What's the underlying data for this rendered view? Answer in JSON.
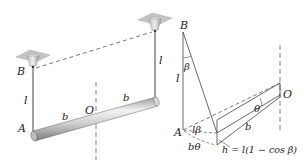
{
  "figure": {
    "left_view": {
      "labels": {
        "B": "B",
        "A": "A",
        "O": "O",
        "l_left": "l",
        "l_right": "l",
        "b_left": "b",
        "b_right": "b"
      },
      "elements": [
        "ceiling-mount-left",
        "ceiling-mount-right",
        "wire-left",
        "wire-right",
        "rod",
        "vertical-axis",
        "dashed-top-line"
      ]
    },
    "right_view": {
      "labels": {
        "B": "B",
        "A": "A",
        "O": "O",
        "l": "l",
        "beta": "β",
        "theta": "θ",
        "l_beta": "lβ",
        "b_theta": "bθ",
        "b": "b",
        "h_formula": "h = l(1 − cos β)"
      }
    }
  },
  "colors": {
    "line": "#444444",
    "rod_light": "#e8e8e8",
    "rod_dark": "#8a8a8a",
    "mount": "#b0b0b0",
    "dashed": "#666666"
  }
}
